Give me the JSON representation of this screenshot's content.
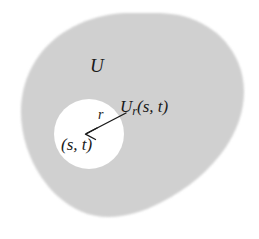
{
  "figure": {
    "kind": "math-set-diagram",
    "width": 259,
    "height": 239,
    "background_color": "#ffffff"
  },
  "region": {
    "name": "U",
    "label": "U",
    "fill_color": "#d2d2d2",
    "texture": "halftone-gray",
    "outline": "none"
  },
  "hole": {
    "name": "U_r(s,t)",
    "label_main": "U",
    "label_sub": "r",
    "label_args": "(s, t)",
    "label_full": "U",
    "fill_color": "#ffffff",
    "center_label": "(s, t)",
    "radius_label": "r",
    "cx": 89,
    "cy": 134,
    "radius": 35
  },
  "arrow": {
    "name": "radius-arrow",
    "from_x": 126,
    "from_y": 113,
    "to_x": 86,
    "to_y": 134,
    "color": "#1a1a1a",
    "head": "open-v"
  },
  "colors": {
    "ink": "#1a1a1a",
    "shade": "#d2d2d2",
    "paper": "#ffffff"
  }
}
